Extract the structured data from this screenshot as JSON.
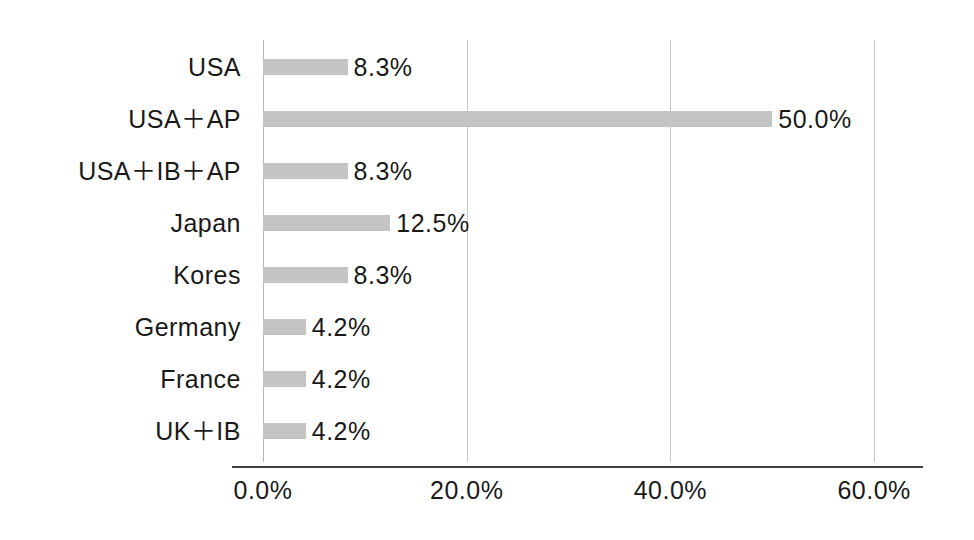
{
  "chart_data": {
    "type": "bar",
    "orientation": "horizontal",
    "title": "",
    "subtitle": "",
    "xlabel": "",
    "ylabel": "",
    "categories": [
      "USA",
      "USA＋AP",
      "USA＋IB＋AP",
      "Japan",
      "Kores",
      "Germany",
      "France",
      "UK＋IB"
    ],
    "values": [
      8.3,
      50.0,
      8.3,
      12.5,
      8.3,
      4.2,
      4.2,
      4.2
    ],
    "data_labels": [
      "8.3%",
      "50.0%",
      "8.3%",
      "12.5%",
      "8.3%",
      "4.2%",
      "4.2%",
      "4.2%"
    ],
    "xlim": [
      0,
      64.8
    ],
    "xticks": [
      0,
      20,
      40,
      60
    ],
    "xtick_labels": [
      "0.0%",
      "20.0%",
      "40.0%",
      "60.0%"
    ],
    "grid": true,
    "grid_axis": "x",
    "legend": false,
    "legend_position": "none",
    "bar_color": "#c4c4c4",
    "gridline_color": "#c9c9c9",
    "axis_color": "#404040",
    "text_color": "#1a1a1a",
    "background_color": "#ffffff"
  }
}
